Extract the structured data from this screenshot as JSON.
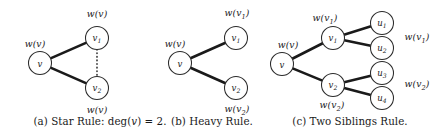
{
  "figure": {
    "width": 440,
    "height": 134,
    "background": "#ffffff",
    "ink_color": "#1a1a1a",
    "panels": [
      {
        "id": "panel-a",
        "caption_prefix": "(a)",
        "caption_text": "(a) Star Rule: deg(v) = 2.",
        "caption_x": 100,
        "nodes": [
          {
            "name": "v",
            "label": "v",
            "sub": "",
            "cx": 40,
            "cy": 63,
            "r": 11.5
          },
          {
            "name": "v1",
            "label": "v",
            "sub": "1",
            "cx": 97,
            "cy": 38,
            "r": 11.5
          },
          {
            "name": "v2",
            "label": "v",
            "sub": "2",
            "cx": 97,
            "cy": 88,
            "r": 11.5
          }
        ],
        "edges": [
          {
            "from": "v",
            "to": "v1",
            "style": "solid"
          },
          {
            "from": "v",
            "to": "v2",
            "style": "solid"
          },
          {
            "from": "v1",
            "to": "v2",
            "style": "dotted"
          }
        ],
        "weights": [
          {
            "name": "weight-v",
            "text": "w(v)",
            "sub": "",
            "x": 35,
            "y": 44
          },
          {
            "name": "weight-v1-above",
            "text": "w(v)",
            "sub": "",
            "x": 97,
            "y": 14
          },
          {
            "name": "weight-v2-below",
            "text": "w(v)",
            "sub": "",
            "x": 97,
            "y": 110
          }
        ]
      },
      {
        "id": "panel-b",
        "caption_prefix": "(b)",
        "caption_text": "(b) Heavy Rule.",
        "caption_x": 212,
        "nodes": [
          {
            "name": "v",
            "label": "v",
            "sub": "",
            "cx": 180,
            "cy": 63,
            "r": 11.5
          },
          {
            "name": "v1",
            "label": "v",
            "sub": "1",
            "cx": 236,
            "cy": 38,
            "r": 11.5
          },
          {
            "name": "v2",
            "label": "v",
            "sub": "2",
            "cx": 236,
            "cy": 88,
            "r": 11.5
          }
        ],
        "edges": [
          {
            "from": "v",
            "to": "v1",
            "style": "solid"
          },
          {
            "from": "v",
            "to": "v2",
            "style": "solid"
          }
        ],
        "weights": [
          {
            "name": "weight-v",
            "text": "w(v",
            "sub": "",
            "x": 175,
            "y": 44
          },
          {
            "name": "weight-v1",
            "text": "w(v",
            "sub": "1",
            "x": 237,
            "y": 14
          },
          {
            "name": "weight-v2",
            "text": "w(v",
            "sub": "2",
            "x": 237,
            "y": 110
          }
        ]
      },
      {
        "id": "panel-c",
        "caption_prefix": "(c)",
        "caption_text": "(c) Two Siblings Rule.",
        "caption_x": 350,
        "nodes": [
          {
            "name": "v",
            "label": "v",
            "sub": "",
            "cx": 282,
            "cy": 64,
            "r": 11.5
          },
          {
            "name": "v1",
            "label": "v",
            "sub": "1",
            "cx": 333,
            "cy": 38,
            "r": 11.5
          },
          {
            "name": "v2",
            "label": "v",
            "sub": "2",
            "cx": 333,
            "cy": 85,
            "r": 11.5
          },
          {
            "name": "u1",
            "label": "u",
            "sub": "1",
            "cx": 382,
            "cy": 23,
            "r": 11.5
          },
          {
            "name": "u2",
            "label": "u",
            "sub": "2",
            "cx": 382,
            "cy": 48,
            "r": 11.5
          },
          {
            "name": "u3",
            "label": "u",
            "sub": "3",
            "cx": 382,
            "cy": 73,
            "r": 11.5
          },
          {
            "name": "u4",
            "label": "u",
            "sub": "4",
            "cx": 382,
            "cy": 98,
            "r": 11.5
          }
        ],
        "edges": [
          {
            "from": "v",
            "to": "v1",
            "style": "solid"
          },
          {
            "from": "v",
            "to": "v2",
            "style": "solid"
          },
          {
            "from": "v1",
            "to": "u1",
            "style": "solid"
          },
          {
            "from": "v1",
            "to": "u2",
            "style": "solid"
          },
          {
            "from": "v2",
            "to": "u3",
            "style": "solid"
          },
          {
            "from": "v2",
            "to": "u4",
            "style": "solid"
          }
        ],
        "weights": [
          {
            "name": "weight-v",
            "text": "w(v",
            "sub": "",
            "x": 288,
            "y": 45
          },
          {
            "name": "weight-v1-above",
            "text": "w(v",
            "sub": "1",
            "x": 325,
            "y": 19
          },
          {
            "name": "weight-v2-below",
            "text": "w(v",
            "sub": "2",
            "x": 332,
            "y": 106
          },
          {
            "name": "weight-u12",
            "text": "w(v",
            "sub": "1",
            "x": 417,
            "y": 38
          },
          {
            "name": "weight-u34",
            "text": "w(v",
            "sub": "2",
            "x": 417,
            "y": 85
          }
        ]
      }
    ]
  }
}
